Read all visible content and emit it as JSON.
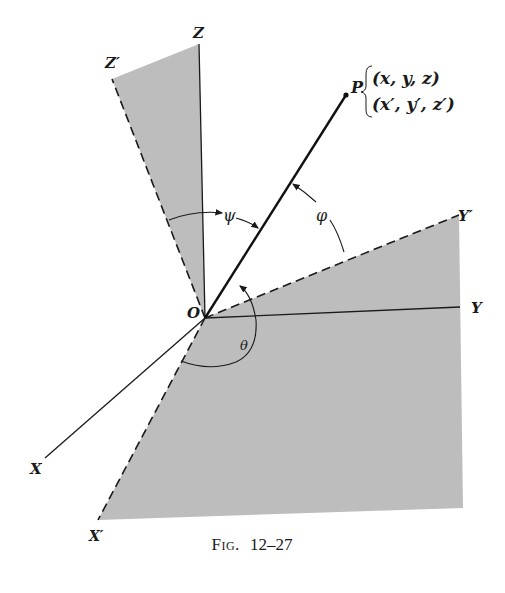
{
  "figure": {
    "caption": "Fig. 12–27",
    "caption_prefix": "Fig.",
    "caption_number": "12–27"
  },
  "labels": {
    "origin": "O",
    "x_axis": "X",
    "y_axis": "Y",
    "z_axis": "Z",
    "x_prime_axis": "X′",
    "y_prime_axis": "Y′",
    "z_prime_axis": "Z′",
    "point": "P",
    "coords_unprimed": "(x, y, z)",
    "coords_primed": "(x′, y′, z′)",
    "angle_theta": "θ",
    "angle_phi": "φ",
    "angle_psi": "ψ"
  },
  "colors": {
    "shading": "#bdbdbd",
    "ink": "#1a1a1a",
    "background": "#ffffff"
  }
}
